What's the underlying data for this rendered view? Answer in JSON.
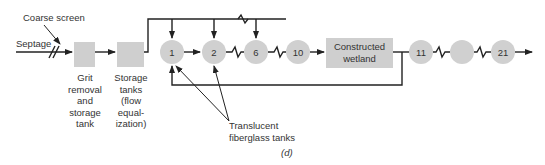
{
  "figure": {
    "caption": "(d)",
    "labels": {
      "coarse_screen": "Coarse screen",
      "septage": "Septage",
      "grit": [
        "Grit",
        "removal",
        "and",
        "storage",
        "tank"
      ],
      "storage": [
        "Storage",
        "tanks",
        "(flow",
        "equal-",
        "ization)"
      ],
      "translucent": [
        "Translucent",
        "fiberglass tanks"
      ],
      "wetland": [
        "Constructed",
        "wetland"
      ]
    },
    "nodes": [
      {
        "id": "tank-1",
        "label": "1"
      },
      {
        "id": "tank-2",
        "label": "2"
      },
      {
        "id": "tank-6",
        "label": "6"
      },
      {
        "id": "tank-10",
        "label": "10"
      },
      {
        "id": "tank-11",
        "label": "11"
      },
      {
        "id": "tank-unlabeled",
        "label": ""
      },
      {
        "id": "tank-21",
        "label": "21"
      }
    ],
    "colors": {
      "box_fill": "#cfcfcf",
      "circle_fill": "#d0d0d0",
      "line": "#222222"
    }
  }
}
